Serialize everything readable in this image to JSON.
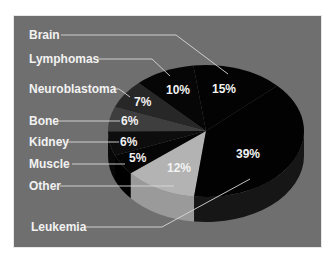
{
  "chart_data": {
    "type": "pie",
    "title": "",
    "style": "3d-pie",
    "legend_position": "none (leader-line labels on left)",
    "categories": [
      "Leukemia",
      "Brain",
      "Lymphomas",
      "Neuroblastoma",
      "Bone",
      "Kidney",
      "Muscle",
      "Other"
    ],
    "values": [
      39,
      15,
      10,
      7,
      6,
      6,
      5,
      12
    ],
    "unit": "%",
    "slices": [
      {
        "name": "Other",
        "value": 12,
        "label": "12%",
        "color": "#b3b3b3",
        "side_color": "#9a9a9a",
        "start_deg": 97,
        "end_deg": 140.2
      },
      {
        "name": "Muscle",
        "value": 5,
        "label": "5%",
        "color": "#050505",
        "side_color": "#000000",
        "start_deg": 140.2,
        "end_deg": 158.2
      },
      {
        "name": "Kidney",
        "value": 6,
        "label": "6%",
        "color": "#0d0d0d",
        "side_color": "#080808",
        "start_deg": 158.2,
        "end_deg": 179.8
      },
      {
        "name": "Bone",
        "value": 6,
        "label": "6%",
        "color": "#3e3e3e",
        "side_color": "#333333",
        "start_deg": 179.8,
        "end_deg": 201.4
      },
      {
        "name": "Neuroblastoma",
        "value": 7,
        "label": "7%",
        "color": "#272727",
        "side_color": "#1e1e1e",
        "start_deg": 201.4,
        "end_deg": 226.6
      },
      {
        "name": "Lymphomas",
        "value": 10,
        "label": "10%",
        "color": "#060606",
        "side_color": "#030303",
        "start_deg": 226.6,
        "end_deg": 262.6
      },
      {
        "name": "Brain",
        "value": 15,
        "label": "15%",
        "color": "#030303",
        "side_color": "#020202",
        "start_deg": 262.6,
        "end_deg": 316.6
      },
      {
        "name": "Leukemia",
        "value": 39,
        "label": "39%",
        "color": "#020202",
        "side_color": "#161616",
        "start_deg": 316.6,
        "end_deg": 457
      }
    ]
  },
  "labels": {
    "brain": "Brain",
    "lymphomas": "Lymphomas",
    "neuroblastoma": "Neuroblastoma",
    "bone": "Bone",
    "kidney": "Kidney",
    "muscle": "Muscle",
    "other": "Other",
    "leukemia": "Leukemia"
  },
  "percents": {
    "brain": "15%",
    "lymphomas": "10%",
    "neuroblastoma": "7%",
    "bone": "6%",
    "kidney": "6%",
    "muscle": "5%",
    "other": "12%",
    "leukemia": "39%"
  },
  "colors": {
    "background": "#6f6f6f",
    "frame_border": "#ffffff",
    "text": "#f2f2f2",
    "leader_lines": "#d8d8d8"
  }
}
